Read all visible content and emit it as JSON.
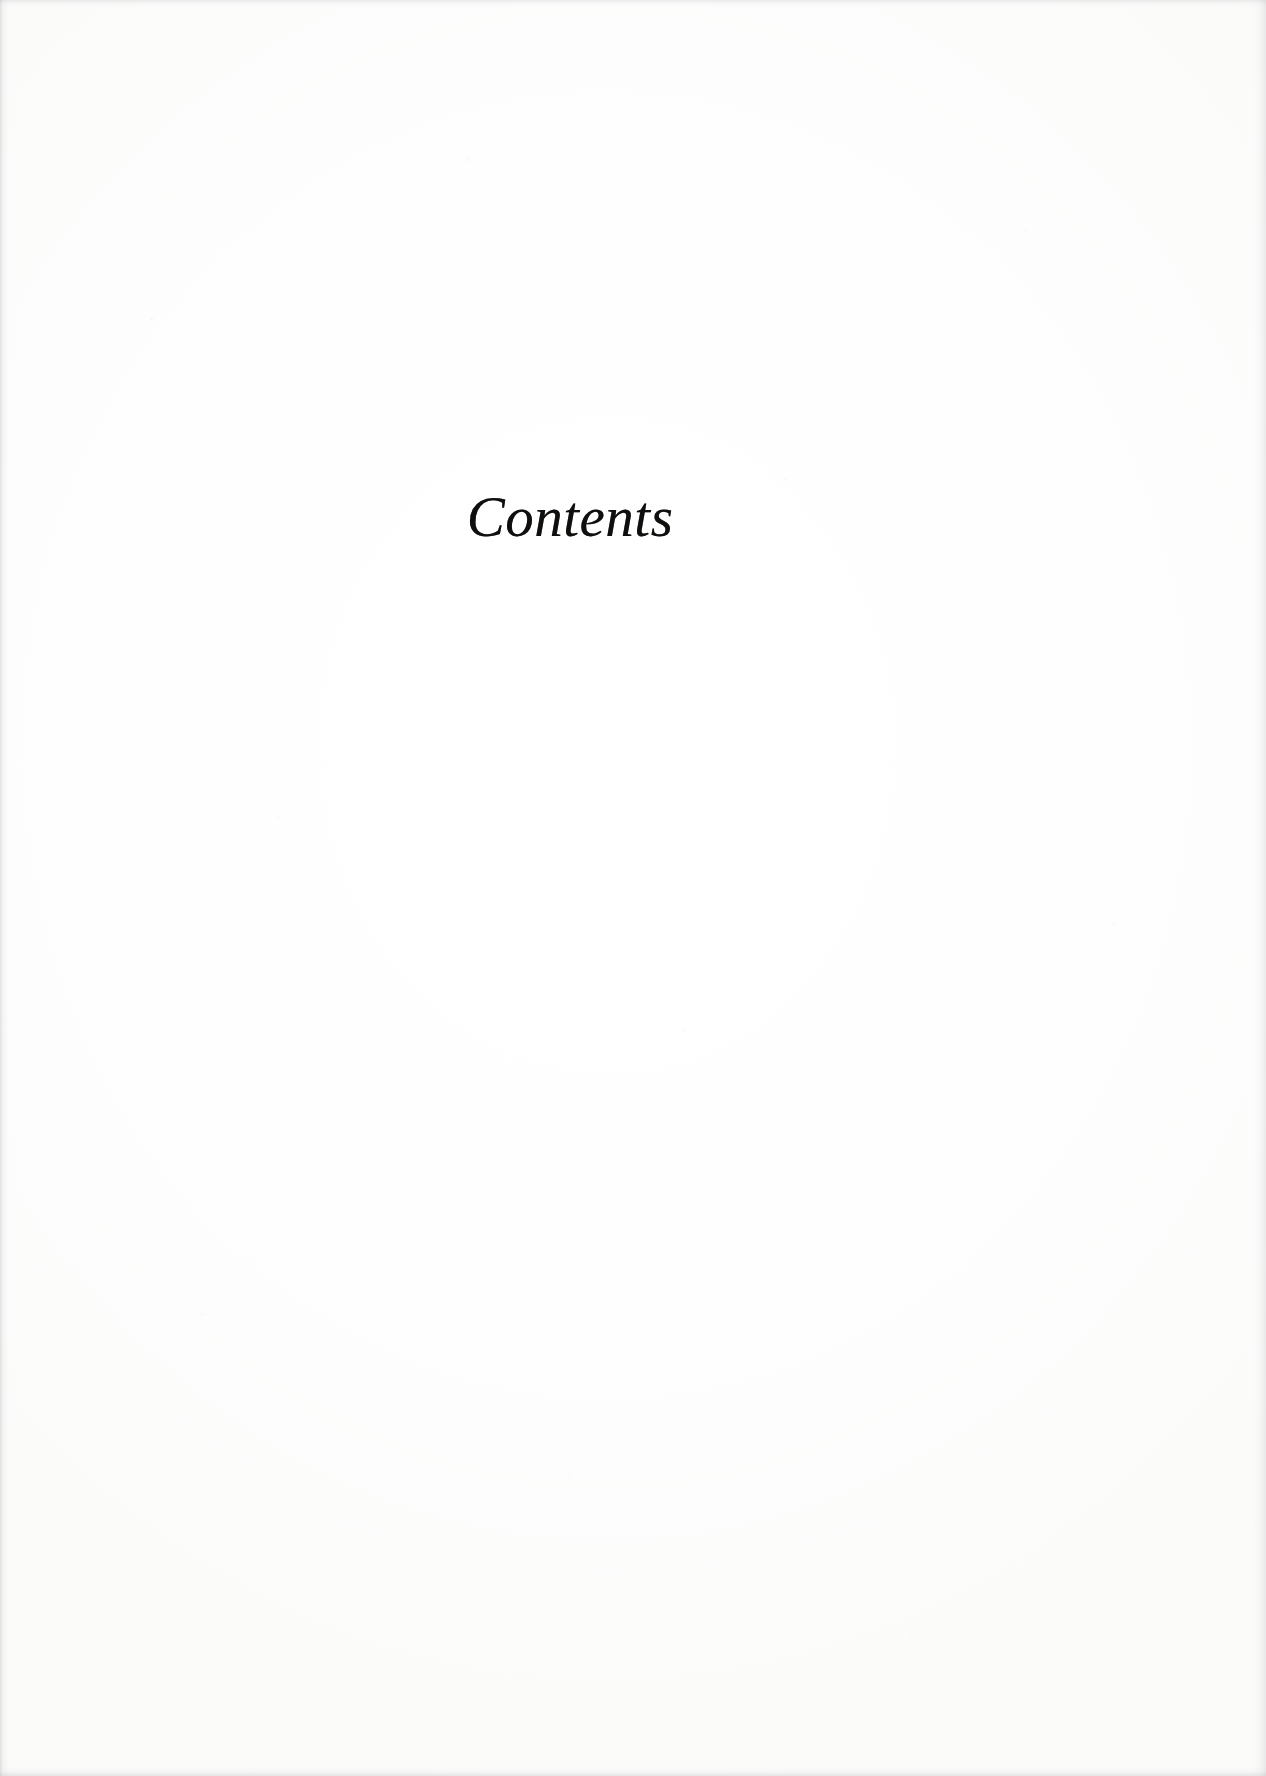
{
  "page": {
    "kind": "book-section-divider",
    "paper_color": "#fdfdfc",
    "ink_color": "#100f0d",
    "width_px": 1266,
    "height_px": 1776
  },
  "heading": {
    "text": "Contents",
    "style": "italic-serif",
    "align": "center"
  },
  "body": {
    "entries": []
  }
}
